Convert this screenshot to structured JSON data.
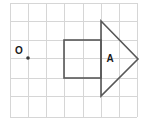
{
  "figure": {
    "canvas": {
      "width": 146,
      "height": 123,
      "background": "#ffffff"
    },
    "grid": {
      "line_color": "#d6d6d6",
      "cell_size": 18.1,
      "columns": 7,
      "rows": 6,
      "x_lines": [
        10,
        28,
        46,
        64,
        83,
        101,
        119,
        137
      ],
      "y_lines": [
        3,
        21,
        40,
        58,
        78,
        96,
        117
      ]
    },
    "stroke_color": "#585858",
    "labels": {
      "origin": "O",
      "shape": "A"
    },
    "points": {
      "origin_dot": {
        "x": 28,
        "y": 58
      },
      "origin_label_pos": {
        "x": 19,
        "y": 51
      },
      "shape_label_pos": {
        "x": 110,
        "y": 59
      }
    },
    "shapes": [
      {
        "name": "square",
        "type": "rect",
        "x": 64,
        "y": 40,
        "width": 37,
        "height": 38,
        "corners": [
          [
            64,
            40
          ],
          [
            101,
            40
          ],
          [
            101,
            78
          ],
          [
            64,
            78
          ]
        ]
      },
      {
        "name": "triangle",
        "type": "polygon",
        "points": "101,21 138,59 101,96",
        "vertices": [
          [
            101,
            21
          ],
          [
            138,
            59
          ],
          [
            101,
            96
          ]
        ]
      }
    ]
  }
}
